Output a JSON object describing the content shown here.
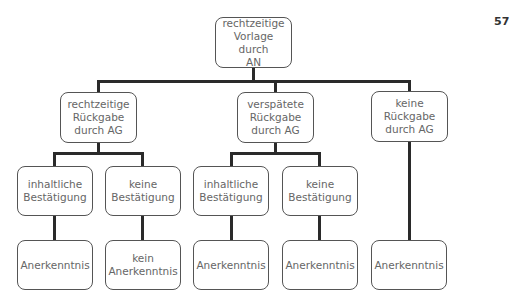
{
  "page_number": "57",
  "nodes": {
    "root": "rechtzeitige\nVorlage durch\nAN",
    "l2_left": "rechtzeitige\nRückgabe\ndurch AG",
    "l2_mid": "verspätete\nRückgabe\ndurch AG",
    "l2_right": "keine\nRückgabe\ndurch AG",
    "l3_1": "inhaltliche\nBestätigung",
    "l3_2": "keine\nBestätigung",
    "l3_3": "inhaltliche\nBestätigung",
    "l3_4": "keine\nBestätigung",
    "l4_1": "Anerkenntnis",
    "l4_2": "kein\nAnerkenntnis",
    "l4_3": "Anerkenntnis",
    "l4_4": "Anerkenntnis",
    "l4_5": "Anerkenntnis"
  },
  "edges": [
    [
      "root",
      "l2_left"
    ],
    [
      "root",
      "l2_mid"
    ],
    [
      "root",
      "l2_right"
    ],
    [
      "l2_left",
      "l3_1"
    ],
    [
      "l2_left",
      "l3_2"
    ],
    [
      "l2_mid",
      "l3_3"
    ],
    [
      "l2_mid",
      "l3_4"
    ],
    [
      "l2_right",
      "l4_5"
    ],
    [
      "l3_1",
      "l4_1"
    ],
    [
      "l3_2",
      "l4_2"
    ],
    [
      "l3_3",
      "l4_3"
    ],
    [
      "l3_4",
      "l4_4"
    ]
  ]
}
